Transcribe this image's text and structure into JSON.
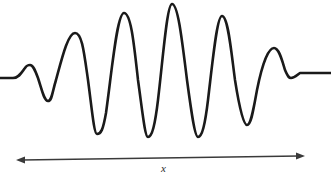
{
  "figure": {
    "background_color": "#ffffff",
    "width": 331,
    "height": 185
  },
  "axis": {
    "label": "x",
    "label_color": "#2b2b2b",
    "arrow": {
      "style": "double-headed",
      "color": "#3a3a3a",
      "stroke_width": 1.6,
      "x_start": 16,
      "y_start": 160,
      "x_end": 305,
      "y_end": 156,
      "head_length": 9,
      "head_width": 7
    }
  },
  "wave": {
    "stroke_color": "#1a1a1a",
    "stroke_width": 2.6,
    "baseline_left_y": 78,
    "baseline_right_y": 73
  },
  "chart_data": {
    "type": "line",
    "xlabel": "x",
    "ylabel": "",
    "grid": false,
    "legend": null,
    "xlim": [
      0,
      331
    ],
    "ylim": [
      185,
      0
    ],
    "note": "Pixel coordinates; y increases downward. Baseline (zero amplitude) near y = 75.",
    "extrema": [
      {
        "kind": "tail-start",
        "x": 0,
        "y": 78
      },
      {
        "kind": "peak",
        "x": 30,
        "y": 65
      },
      {
        "kind": "trough",
        "x": 48,
        "y": 101
      },
      {
        "kind": "peak",
        "x": 75,
        "y": 33
      },
      {
        "kind": "trough",
        "x": 97,
        "y": 134
      },
      {
        "kind": "peak",
        "x": 124,
        "y": 13
      },
      {
        "kind": "trough",
        "x": 148,
        "y": 137
      },
      {
        "kind": "peak",
        "x": 172,
        "y": 4
      },
      {
        "kind": "trough",
        "x": 198,
        "y": 137
      },
      {
        "kind": "peak",
        "x": 222,
        "y": 16
      },
      {
        "kind": "trough",
        "x": 247,
        "y": 125
      },
      {
        "kind": "peak",
        "x": 274,
        "y": 48
      },
      {
        "kind": "trough",
        "x": 291,
        "y": 78
      },
      {
        "kind": "tail-end",
        "x": 331,
        "y": 73
      }
    ],
    "path": "M 0,78 L 13,78 C 19,78 22,72 25,68 C 27,65 28,65 30,65 C 33,65 35,70 38,78 C 42,90 44,101 48,101 C 52,101 52,93 56,80 C 62,58 68,33 75,33 C 82,33 84,52 88,80 C 92,110 94,134 97,134 C 101,134 103,130 106,113 C 112,70 117,13 124,13 C 131,13 134,44 138,80 C 143,116 145,137 148,137 C 152,137 155,125 158,100 C 163,58 167,4 172,4 C 178,4 182,40 187,80 C 192,117 195,137 198,137 C 202,137 205,125 208,100 C 213,58 217,16 222,16 C 228,16 231,50 235,80 C 240,112 244,125 247,125 C 251,125 253,112 257,90 C 263,60 269,48 274,48 C 279,48 282,60 285,70 C 288,77 289,78 291,78 C 295,78 297,75 300,73 L 331,73"
  }
}
